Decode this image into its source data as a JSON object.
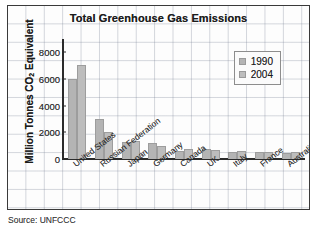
{
  "figure": {
    "source_note": "Source: UNFCCC"
  },
  "legend": {
    "position": "top-right",
    "entries": [
      {
        "label": "1990",
        "color": "#b4b4b4"
      },
      {
        "label": "2004",
        "color": "#bdbdbd"
      }
    ]
  },
  "axis": {
    "y_title_main": "Million Tonnes CO",
    "y_title_sub": "2",
    "y_title_tail": " Equivalent",
    "y_ticks": [
      "0",
      "2000",
      "4000",
      "6000",
      "8000"
    ]
  },
  "chart_data": {
    "type": "bar",
    "title": "Total Greenhouse Gas Emissions",
    "xlabel": "",
    "ylabel": "Million Tonnes CO2 Equivalent",
    "ylim": [
      0,
      9000
    ],
    "ytick_values": [
      0,
      2000,
      4000,
      6000,
      8000
    ],
    "grid": true,
    "legend_position": "top-right",
    "categories": [
      "United States",
      "Russian Federation",
      "Japan",
      "Germany",
      "Canada",
      "UK",
      "Italy",
      "France",
      "Australia"
    ],
    "series": [
      {
        "name": "1990",
        "color": "#b4b4b4",
        "values": [
          6000,
          3000,
          1250,
          1200,
          600,
          750,
          520,
          550,
          450
        ]
      },
      {
        "name": "2004",
        "color": "#bdbdbd",
        "values": [
          7050,
          2000,
          1350,
          1000,
          750,
          700,
          580,
          560,
          550
        ]
      }
    ],
    "source": "UNFCCC"
  }
}
